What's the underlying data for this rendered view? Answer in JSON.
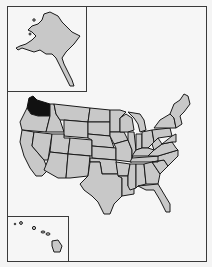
{
  "map": {
    "type": "state-locator",
    "subject": "United States",
    "highlighted_state": "Washington",
    "insets": [
      "Alaska",
      "Hawaii"
    ],
    "colors": {
      "background": "#f6f6f6",
      "state_fill": "#c8c8c8",
      "highlight_fill": "#111111",
      "border": "#1a1a1a",
      "frame": "#3a3a3a"
    }
  }
}
